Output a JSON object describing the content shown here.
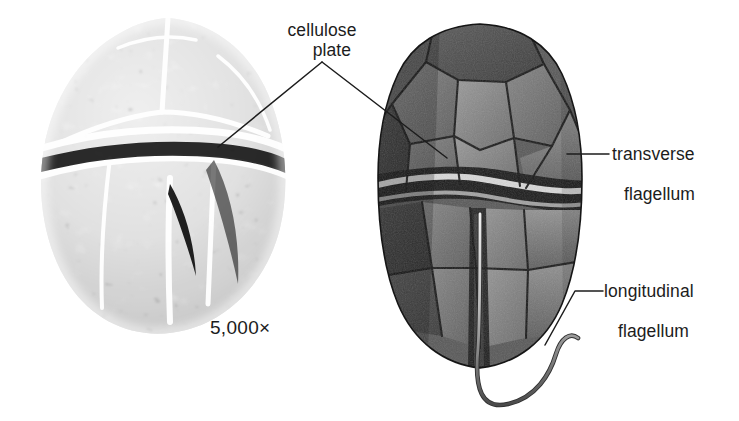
{
  "figure": {
    "kind": "biology-diagram",
    "background_color": "#ffffff",
    "text_color": "#1c1c1c",
    "leader_line_color": "#1c1c1c"
  },
  "labels": {
    "cellulose_plate": {
      "line1": "cellulose",
      "line2": "plate"
    },
    "transverse_flagellum": {
      "line1": "transverse",
      "line2": "flagellum"
    },
    "longitudinal_flagellum": {
      "line1": "longitudinal",
      "line2": "flagellum"
    },
    "magnification": "5,000×"
  },
  "panels": {
    "left": {
      "name": "scanning electron micrograph",
      "style": "black-and-white reticulated thecal plates",
      "magnification": "5,000×"
    },
    "right": {
      "name": "grayscale illustration",
      "style": "shaded drawing of cellulose plates, cingulum groove and two flagella"
    }
  },
  "leaders": {
    "cellulose_plate_left": "apex (322,62) to (218,147)",
    "cellulose_plate_right": "apex (322,62) to (447,158)",
    "transverse_flagellum": "horizontal (567,154) to (609,154)",
    "longitudinal_flagellum": "elbow (545,345) to (575,291) to (604,291)"
  }
}
